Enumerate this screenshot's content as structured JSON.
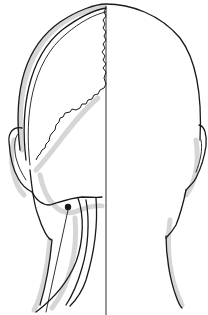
{
  "figure": {
    "left_half": "skull and occipital muscle structures with sutures",
    "right_half": "head outline",
    "marker": {
      "type": "point",
      "color": "#1a1a1a"
    },
    "colors": {
      "ink": "#1a1a1a",
      "shade": "#d6d6d6",
      "background": "#ffffff"
    }
  }
}
